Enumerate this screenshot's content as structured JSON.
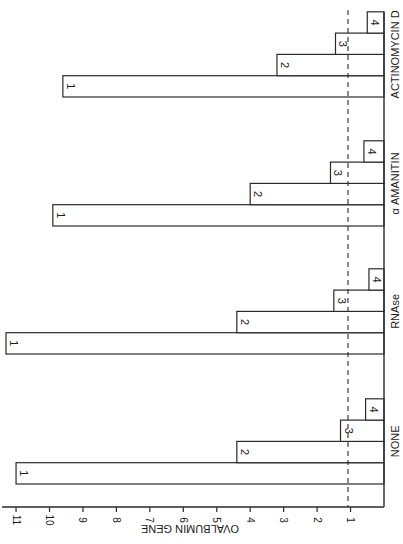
{
  "chart_data": {
    "type": "bar",
    "orientation": "rotated-90 (bars extend leftward from baseline on right)",
    "title": "",
    "xlabel": "",
    "ylabel": "OVALBUMIN GENE",
    "ylim": [
      0,
      11
    ],
    "yticks": [
      "1",
      "2",
      "3",
      "4",
      "5",
      "6",
      "7",
      "8",
      "9",
      "10",
      "11"
    ],
    "reference_line": {
      "value": 1,
      "style": "dashed"
    },
    "categories": [
      "NONE",
      "RNAse",
      "α AMANITIN",
      "ACTINOMYCIN D"
    ],
    "series": [
      {
        "name": "1",
        "values": [
          11.0,
          11.3,
          9.9,
          9.6
        ]
      },
      {
        "name": "2",
        "values": [
          4.4,
          4.4,
          4.0,
          3.2
        ]
      },
      {
        "name": "3",
        "values": [
          1.3,
          1.5,
          1.6,
          1.45
        ]
      },
      {
        "name": "4",
        "values": [
          0.55,
          0.45,
          0.6,
          0.5
        ]
      }
    ],
    "grid": false,
    "legend": "bars labeled inline 1-4"
  }
}
